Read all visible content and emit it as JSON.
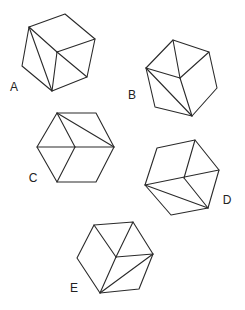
{
  "figures": [
    {
      "label": "A",
      "label_pos": [
        14,
        87
      ],
      "outline": [
        [
          29,
          27
        ],
        [
          65,
          14
        ],
        [
          95,
          39
        ],
        [
          87,
          77
        ],
        [
          52,
          91
        ],
        [
          22,
          66
        ]
      ],
      "lines": [
        [
          [
            29,
            27
          ],
          [
            57,
            52
          ]
        ],
        [
          [
            57,
            52
          ],
          [
            95,
            39
          ]
        ],
        [
          [
            57,
            52
          ],
          [
            52,
            91
          ]
        ],
        [
          [
            29,
            27
          ],
          [
            52,
            91
          ]
        ],
        [
          [
            57,
            52
          ],
          [
            87,
            77
          ]
        ]
      ]
    },
    {
      "label": "B",
      "label_pos": [
        132,
        95
      ],
      "outline": [
        [
          173,
          40
        ],
        [
          209,
          52
        ],
        [
          217,
          88
        ],
        [
          192,
          116
        ],
        [
          155,
          107
        ],
        [
          146,
          68
        ]
      ],
      "lines": [
        [
          [
            173,
            40
          ],
          [
            180,
            78
          ]
        ],
        [
          [
            146,
            68
          ],
          [
            180,
            78
          ]
        ],
        [
          [
            180,
            78
          ],
          [
            209,
            52
          ]
        ],
        [
          [
            146,
            68
          ],
          [
            192,
            116
          ]
        ],
        [
          [
            180,
            78
          ],
          [
            192,
            116
          ]
        ]
      ]
    },
    {
      "label": "C",
      "label_pos": [
        33,
        178
      ],
      "outline": [
        [
          57,
          113
        ],
        [
          96,
          113
        ],
        [
          114,
          147
        ],
        [
          96,
          182
        ],
        [
          57,
          182
        ],
        [
          37,
          147
        ]
      ],
      "lines": [
        [
          [
            37,
            147
          ],
          [
            114,
            147
          ]
        ],
        [
          [
            57,
            113
          ],
          [
            75,
            147
          ]
        ],
        [
          [
            57,
            113
          ],
          [
            114,
            147
          ]
        ],
        [
          [
            75,
            147
          ],
          [
            57,
            182
          ]
        ]
      ]
    },
    {
      "label": "D",
      "label_pos": [
        227,
        200
      ],
      "outline": [
        [
          157,
          148
        ],
        [
          195,
          140
        ],
        [
          219,
          170
        ],
        [
          208,
          208
        ],
        [
          171,
          215
        ],
        [
          145,
          185
        ]
      ],
      "lines": [
        [
          [
            195,
            140
          ],
          [
            184,
            178
          ]
        ],
        [
          [
            145,
            185
          ],
          [
            219,
            170
          ]
        ],
        [
          [
            184,
            178
          ],
          [
            208,
            208
          ]
        ],
        [
          [
            145,
            185
          ],
          [
            208,
            208
          ]
        ]
      ]
    },
    {
      "label": "E",
      "label_pos": [
        74,
        288
      ],
      "outline": [
        [
          94,
          225
        ],
        [
          133,
          222
        ],
        [
          153,
          254
        ],
        [
          139,
          289
        ],
        [
          100,
          293
        ],
        [
          77,
          258
        ]
      ],
      "lines": [
        [
          [
            94,
            225
          ],
          [
            116,
            257
          ]
        ],
        [
          [
            133,
            222
          ],
          [
            116,
            257
          ]
        ],
        [
          [
            116,
            257
          ],
          [
            153,
            254
          ]
        ],
        [
          [
            116,
            257
          ],
          [
            100,
            293
          ]
        ],
        [
          [
            100,
            293
          ],
          [
            153,
            254
          ]
        ]
      ]
    }
  ]
}
